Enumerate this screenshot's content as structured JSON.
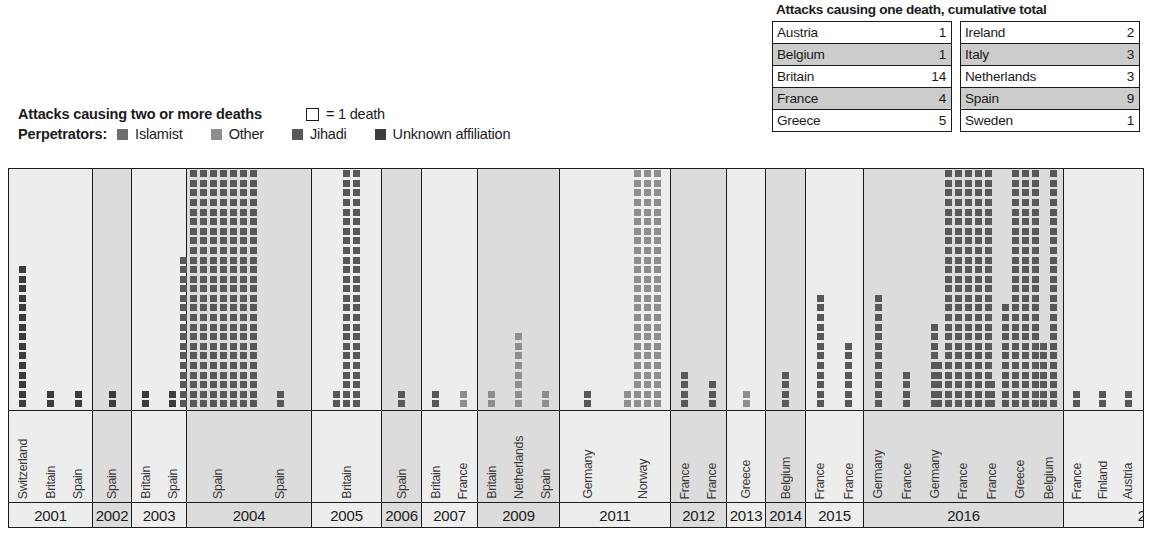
{
  "colors": {
    "islamist": "#6f6f6f",
    "other": "#8e8e8e",
    "jihadi": "#585858",
    "unknown": "#3c3c3c",
    "ink": "#1b1b1b",
    "shade_light": "#ededed",
    "shade_dark": "#dcdcdc",
    "table_shade": "#cccccc"
  },
  "legend": {
    "title": "Attacks causing two or more deaths",
    "unit_label": "= 1 death",
    "unit_swatch": "open-square",
    "perpetrators_label": "Perpetrators:",
    "items": [
      {
        "label": "Islamist",
        "color": "#6f6f6f"
      },
      {
        "label": "Other",
        "color": "#8e8e8e"
      },
      {
        "label": "Jihadi",
        "color": "#585858"
      },
      {
        "label": "Unknown affiliation",
        "color": "#3c3c3c"
      }
    ]
  },
  "table": {
    "title": "Attacks causing one death, cumulative total",
    "left": [
      {
        "country": "Austria",
        "value": "1",
        "shade": false
      },
      {
        "country": "Belgium",
        "value": "1",
        "shade": true
      },
      {
        "country": "Britain",
        "value": "14",
        "shade": false
      },
      {
        "country": "France",
        "value": "4",
        "shade": true
      },
      {
        "country": "Greece",
        "value": "5",
        "shade": false
      }
    ],
    "right": [
      {
        "country": "Ireland",
        "value": "2",
        "shade": false
      },
      {
        "country": "Italy",
        "value": "3",
        "shade": true
      },
      {
        "country": "Netherlands",
        "value": "3",
        "shade": false
      },
      {
        "country": "Spain",
        "value": "9",
        "shade": true
      },
      {
        "country": "Sweden",
        "value": "1",
        "shade": false
      }
    ]
  },
  "chart_data": {
    "type": "bar",
    "title": "Attacks causing two or more deaths",
    "unit": "1 square = 1 death",
    "xlabel": "",
    "ylabel": "Deaths",
    "grid": false,
    "legend_position": "top-left",
    "series_note": "Each attack is one column of stacked squares; colour encodes perpetrator affiliation.",
    "years": [
      {
        "year": "2001",
        "shade": "light",
        "width": 84,
        "attacks": [
          {
            "country": "Switzerland",
            "deaths": 15,
            "perp": "unknown",
            "cols": 1
          },
          {
            "country": "Britain",
            "deaths": 2,
            "perp": "unknown",
            "cols": 1
          },
          {
            "country": "Spain",
            "deaths": 2,
            "perp": "unknown",
            "cols": 1
          }
        ]
      },
      {
        "year": "2002",
        "shade": "dark",
        "width": 39,
        "attacks": [
          {
            "country": "Spain",
            "deaths": 2,
            "perp": "unknown",
            "cols": 1
          }
        ]
      },
      {
        "year": "2003",
        "shade": "light",
        "width": 55,
        "attacks": [
          {
            "country": "Britain",
            "deaths": 2,
            "perp": "unknown",
            "cols": 1
          },
          {
            "country": "Spain",
            "deaths": 2,
            "perp": "unknown",
            "cols": 1
          }
        ]
      },
      {
        "year": "2004",
        "shade": "dark",
        "width": 125,
        "attacks": [
          {
            "country": "Spain",
            "deaths": 191,
            "perp": "jihadi",
            "cols": 7
          },
          {
            "country": "Spain",
            "deaths": 2,
            "perp": "jihadi",
            "cols": 1
          }
        ]
      },
      {
        "year": "2005",
        "shade": "light",
        "width": 70,
        "attacks": [
          {
            "country": "Britain",
            "deaths": 52,
            "perp": "jihadi",
            "cols": 3
          }
        ]
      },
      {
        "year": "2006",
        "shade": "dark",
        "width": 40,
        "attacks": [
          {
            "country": "Spain",
            "deaths": 2,
            "perp": "jihadi",
            "cols": 1
          }
        ]
      },
      {
        "year": "2007",
        "shade": "light",
        "width": 56,
        "attacks": [
          {
            "country": "Britain",
            "deaths": 2,
            "perp": "jihadi",
            "cols": 1
          },
          {
            "country": "France",
            "deaths": 2,
            "perp": "other",
            "cols": 1
          }
        ]
      },
      {
        "year": "2009",
        "shade": "dark",
        "width": 82,
        "attacks": [
          {
            "country": "Britain",
            "deaths": 2,
            "perp": "other",
            "cols": 1
          },
          {
            "country": "Netherlands",
            "deaths": 8,
            "perp": "other",
            "cols": 1
          },
          {
            "country": "Spain",
            "deaths": 2,
            "perp": "other",
            "cols": 1
          }
        ]
      },
      {
        "year": "2011",
        "shade": "light",
        "width": 111,
        "attacks": [
          {
            "country": "Germany",
            "deaths": 2,
            "perp": "jihadi",
            "cols": 1
          },
          {
            "country": "Norway",
            "deaths": 77,
            "perp": "other",
            "cols": 4
          }
        ]
      },
      {
        "year": "2012",
        "shade": "dark",
        "width": 56,
        "attacks": [
          {
            "country": "France",
            "deaths": 4,
            "perp": "jihadi",
            "cols": 1
          },
          {
            "country": "France",
            "deaths": 3,
            "perp": "jihadi",
            "cols": 1
          }
        ]
      },
      {
        "year": "2013",
        "shade": "light",
        "width": 39,
        "attacks": [
          {
            "country": "Greece",
            "deaths": 2,
            "perp": "other",
            "cols": 1
          }
        ]
      },
      {
        "year": "2014",
        "shade": "dark",
        "width": 40,
        "attacks": [
          {
            "country": "Belgium",
            "deaths": 4,
            "perp": "jihadi",
            "cols": 1
          }
        ]
      },
      {
        "year": "2015",
        "shade": "light",
        "width": 58,
        "attacks": [
          {
            "country": "France",
            "deaths": 12,
            "perp": "jihadi",
            "cols": 1
          },
          {
            "country": "France",
            "deaths": 7,
            "perp": "jihadi",
            "cols": 1
          }
        ]
      },
      {
        "year": "2016",
        "shade": "dark",
        "width": 200,
        "attacks": [
          {
            "country": "Germany",
            "deaths": 12,
            "perp": "jihadi",
            "cols": 1
          },
          {
            "country": "France",
            "deaths": 4,
            "perp": "jihadi",
            "cols": 1
          },
          {
            "country": "Germany",
            "deaths": 9,
            "perp": "jihadi",
            "cols": 1
          },
          {
            "country": "France",
            "deaths": 130,
            "perp": "jihadi",
            "cols": 5
          },
          {
            "country": "France",
            "deaths": 3,
            "perp": "jihadi",
            "cols": 1
          },
          {
            "country": "Greece",
            "deaths": 86,
            "perp": "jihadi",
            "cols": 3
          },
          {
            "country": "Belgium",
            "deaths": 32,
            "perp": "jihadi",
            "cols": 2
          }
        ]
      },
      {
        "year": "2017",
        "shade": "light",
        "width": 180,
        "attacks": [
          {
            "country": "France",
            "deaths": 2,
            "perp": "jihadi",
            "cols": 1
          },
          {
            "country": "Finland",
            "deaths": 2,
            "perp": "jihadi",
            "cols": 1
          },
          {
            "country": "Austria",
            "deaths": 2,
            "perp": "jihadi",
            "cols": 1
          },
          {
            "country": "UK",
            "deaths": 6,
            "perp": "jihadi",
            "cols": 1
          },
          {
            "country": "UK",
            "deaths": 22,
            "perp": "jihadi",
            "cols": 1
          },
          {
            "country": "Sweden",
            "deaths": 5,
            "perp": "jihadi",
            "cols": 1
          },
          {
            "country": "UK",
            "deaths": 5,
            "perp": "jihadi",
            "cols": 1
          }
        ]
      }
    ]
  }
}
